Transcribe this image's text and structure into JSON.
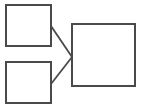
{
  "diagram": {
    "stroke_color": "#4a4a4a",
    "background": "#ffffff",
    "nodes": [
      {
        "id": "top-left-box",
        "label": "",
        "x": 6,
        "y": 5,
        "width": 45,
        "height": 41
      },
      {
        "id": "bottom-left-box",
        "label": "",
        "x": 6,
        "y": 62,
        "width": 45,
        "height": 41
      },
      {
        "id": "right-box",
        "label": "",
        "x": 72,
        "y": 24,
        "width": 63,
        "height": 62
      }
    ],
    "edges": [
      {
        "from": "top-left-box",
        "to": "right-box",
        "x1": 51,
        "y1": 26,
        "x2": 72,
        "y2": 57
      },
      {
        "from": "bottom-left-box",
        "to": "right-box",
        "x1": 51,
        "y1": 84,
        "x2": 72,
        "y2": 57
      }
    ]
  }
}
